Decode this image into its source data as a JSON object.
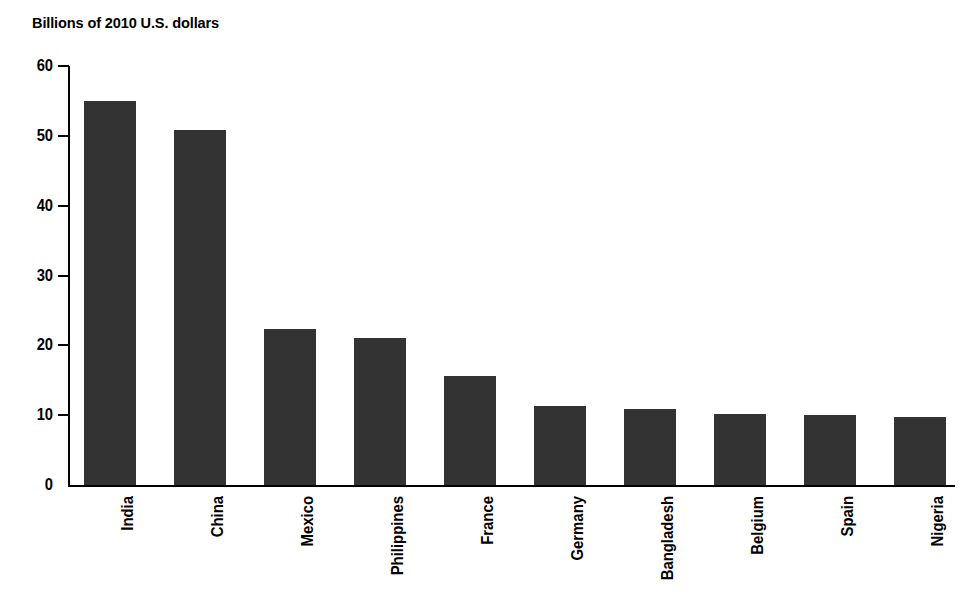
{
  "chart_data": {
    "type": "bar",
    "title": "Billions of 2010 U.S. dollars",
    "subtitle": "",
    "xlabel": "",
    "ylabel": "",
    "ylim": [
      0,
      60
    ],
    "yticks": [
      0,
      10,
      20,
      30,
      40,
      50,
      60
    ],
    "ytick_labels": [
      "0",
      "10",
      "20",
      "30",
      "40",
      "50",
      "60"
    ],
    "grid": false,
    "legend": false,
    "bar_color": "#333333",
    "axis_color": "#000000",
    "background_color": "#ffffff",
    "categories": [
      "India",
      "China",
      "Mexico",
      "Philippines",
      "France",
      "Germany",
      "Bangladesh",
      "Belgium",
      "Spain",
      "Nigeria"
    ],
    "values": [
      55.0,
      50.8,
      22.4,
      21.1,
      15.6,
      11.3,
      10.9,
      10.2,
      10.0,
      9.7
    ]
  }
}
